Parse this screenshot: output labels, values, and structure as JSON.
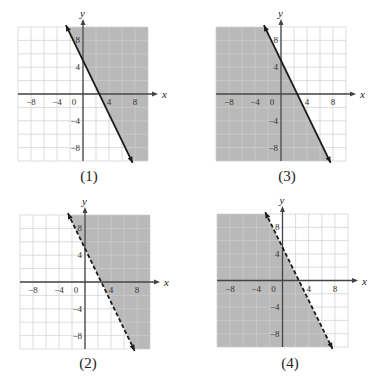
{
  "colors": {
    "shade": "#bdbdbd",
    "grid_light": "#cfcfcf",
    "grid_shaded": "#a9a9a9",
    "axis": "#444444",
    "line": "#1a1a1a"
  },
  "chart_data": [
    {
      "type": "area",
      "caption": "(1)",
      "boundary": "y = -2x + 5",
      "line_style": "solid",
      "shaded_side": "right/above",
      "inequality": "y >= -2x + 5",
      "xlabel": "x",
      "ylabel": "y",
      "xlim": [
        -10,
        10
      ],
      "ylim": [
        -10,
        10
      ],
      "grid": true,
      "grid_step": 2,
      "x_ticks": [
        "-8",
        "-4",
        "0",
        "4",
        "8"
      ],
      "y_ticks": [
        "8",
        "4",
        "-4",
        "-8"
      ],
      "line_points": [
        [
          -2.5,
          10
        ],
        [
          7.5,
          -10
        ]
      ]
    },
    {
      "type": "area",
      "caption": "(2)",
      "boundary": "y = -2x + 5",
      "line_style": "dashed",
      "shaded_side": "right/above",
      "inequality": "y > -2x + 5",
      "xlabel": "x",
      "ylabel": "y",
      "xlim": [
        -10,
        10
      ],
      "ylim": [
        -10,
        10
      ],
      "grid": true,
      "grid_step": 2,
      "x_ticks": [
        "-8",
        "-4",
        "0",
        "4",
        "8"
      ],
      "y_ticks": [
        "8",
        "4",
        "-4",
        "-8"
      ],
      "line_points": [
        [
          -2.5,
          10
        ],
        [
          7.5,
          -10
        ]
      ]
    },
    {
      "type": "area",
      "caption": "(3)",
      "boundary": "y = -2x + 5",
      "line_style": "solid",
      "shaded_side": "left/below",
      "inequality": "y <= -2x + 5",
      "xlabel": "x",
      "ylabel": "y",
      "xlim": [
        -10,
        10
      ],
      "ylim": [
        -10,
        10
      ],
      "grid": true,
      "grid_step": 2,
      "x_ticks": [
        "-8",
        "-4",
        "0",
        "4",
        "8"
      ],
      "y_ticks": [
        "8",
        "4",
        "-4",
        "-8"
      ],
      "line_points": [
        [
          -2.5,
          10
        ],
        [
          7.5,
          -10
        ]
      ]
    },
    {
      "type": "area",
      "caption": "(4)",
      "boundary": "y = -2x + 5",
      "line_style": "dashed",
      "shaded_side": "left/below",
      "inequality": "y < -2x + 5",
      "xlabel": "x",
      "ylabel": "y",
      "xlim": [
        -10,
        10
      ],
      "ylim": [
        -10,
        10
      ],
      "grid": true,
      "grid_step": 2,
      "x_ticks": [
        "-8",
        "-4",
        "0",
        "4",
        "8"
      ],
      "y_ticks": [
        "8",
        "4",
        "-4",
        "-8"
      ],
      "line_points": [
        [
          -2.5,
          10
        ],
        [
          7.5,
          -10
        ]
      ]
    }
  ],
  "panels": [
    {
      "caption": "(1)"
    },
    {
      "caption": "(2)"
    },
    {
      "caption": "(3)"
    },
    {
      "caption": "(4)"
    }
  ]
}
